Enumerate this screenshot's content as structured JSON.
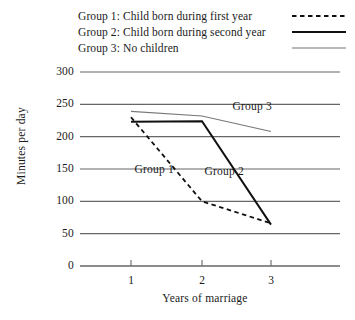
{
  "chart_data": {
    "type": "line",
    "title": "",
    "xlabel": "Years of marriage",
    "ylabel": "Minutes per day",
    "x": [
      1,
      2,
      3
    ],
    "xticklabels": [
      "1",
      "2",
      "3"
    ],
    "yticks": [
      0,
      50,
      100,
      150,
      200,
      250,
      300
    ],
    "yticklabels": [
      "0",
      "50",
      "100",
      "150",
      "200",
      "250",
      "300"
    ],
    "ylim": [
      0,
      300
    ],
    "xlim": [
      0.3,
      3.6
    ],
    "grid": "horizontal",
    "legend_position": "top",
    "series": [
      {
        "name": "Group 1",
        "legend_label": "Group 1: Child born during first year",
        "style": "dashed",
        "color": "#111111",
        "width": 1.8,
        "values": [
          230,
          100,
          66
        ],
        "annotation": "Group 1"
      },
      {
        "name": "Group 2",
        "legend_label": "Group 2: Child born during second year",
        "style": "solid-thick",
        "color": "#111111",
        "width": 2.0,
        "values": [
          223,
          224,
          64
        ],
        "annotation": "Group 2"
      },
      {
        "name": "Group 3",
        "legend_label": "Group 3: No children",
        "style": "solid-thin",
        "color": "#777777",
        "width": 1.2,
        "values": [
          239,
          232,
          208
        ],
        "annotation": "Group 3"
      }
    ],
    "annotations": [
      {
        "text": "Group 1",
        "x": 1.05,
        "y": 148
      },
      {
        "text": "Group 2",
        "x": 2.05,
        "y": 145
      },
      {
        "text": "Group 3",
        "x": 2.45,
        "y": 246
      }
    ],
    "axis_color": "#666666",
    "grid_color": "#666666"
  }
}
